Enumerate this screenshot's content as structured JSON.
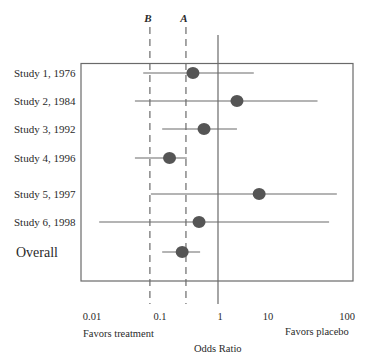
{
  "chart_data": {
    "type": "forest",
    "title": "",
    "xlabel": "Odds Ratio",
    "xscale": "log",
    "xlim": [
      0.01,
      100
    ],
    "x_ticks": [
      {
        "value": 0.01,
        "label": "0.01"
      },
      {
        "value": 0.1,
        "label": "0.1"
      },
      {
        "value": 1,
        "label": "1"
      },
      {
        "value": 10,
        "label": "10"
      },
      {
        "value": 100,
        "label": "100"
      }
    ],
    "annotations": {
      "left": "Favors treatment",
      "right": "Favors placebo"
    },
    "reference_lines": [
      {
        "label": "B",
        "value": 0.083,
        "style": "dashed"
      },
      {
        "label": "A",
        "value": 0.31,
        "style": "dashed"
      },
      {
        "label": "",
        "value": 1,
        "style": "solid"
      }
    ],
    "studies": [
      {
        "label": "Study 1, 1976",
        "or": 0.4,
        "ci_low": 0.065,
        "ci_high": 3.7
      },
      {
        "label": "Study 2, 1984",
        "or": 2.0,
        "ci_low": 0.048,
        "ci_high": 38
      },
      {
        "label": "Study 3, 1992",
        "or": 0.6,
        "ci_low": 0.13,
        "ci_high": 2.0
      },
      {
        "label": "Study 4, 1996",
        "or": 0.17,
        "ci_low": 0.048,
        "ci_high": 0.32
      },
      {
        "label": "Study 5, 1997",
        "or": 4.5,
        "ci_low": 0.086,
        "ci_high": 77
      },
      {
        "label": "Study 6, 1998",
        "or": 0.5,
        "ci_low": 0.013,
        "ci_high": 58
      }
    ],
    "overall": {
      "label": "Overall",
      "or": 0.27,
      "ci_low": 0.13,
      "ci_high": 0.52
    },
    "grid": false,
    "legend": "none"
  },
  "layout": {
    "row_y": [
      73,
      101,
      129,
      158,
      194,
      222
    ],
    "overall_y": 252,
    "tick_label_x": [
      92,
      160,
      220,
      268,
      347
    ]
  },
  "colors": {
    "line": "#6a6a6a",
    "marker": "#555555",
    "frame": "#6a6a6a",
    "text": "#2a2a2a"
  }
}
